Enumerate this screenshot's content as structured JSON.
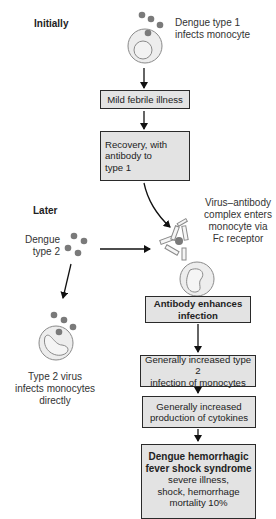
{
  "phases": {
    "initially": "Initially",
    "later": "Later"
  },
  "labels": {
    "dengue1": [
      "Dengue type 1",
      "infects monocyte"
    ],
    "dengue2": [
      "Dengue",
      "type 2"
    ],
    "complex": [
      "Virus–antibody",
      "complex enters",
      "monocyte via",
      "Fc receptor"
    ],
    "direct": [
      "Type 2 virus",
      "infects monocytes",
      "directly"
    ]
  },
  "boxes": {
    "mild": "Mild febrile illness",
    "recovery": [
      "Recovery, with",
      "antibody to",
      "type 1"
    ],
    "enhance": [
      "Antibody enhances",
      "infection"
    ],
    "increased_infection": [
      "Generally increased type 2",
      "infection of monocytes"
    ],
    "cytokines": [
      "Generally increased",
      "production of cytokines"
    ],
    "dhf": {
      "title": [
        "Dengue hemorrhagic",
        "fever shock syndrome"
      ],
      "details": [
        "severe illness,",
        "shock, hemorrhage",
        "mortality 10%"
      ]
    }
  },
  "icons": [
    "virus-particle-icon",
    "monocyte-icon",
    "antibody-icon",
    "arrow-icon"
  ],
  "colors": {
    "box_fill": "#e3e3e3",
    "box_border": "#2a2a2a",
    "virus": "#7a7a7a",
    "cell_fill": "#ececec",
    "cell_border": "#8a8a8a"
  }
}
